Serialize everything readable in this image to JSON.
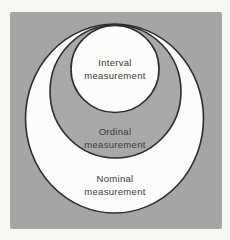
{
  "figure": {
    "colors": {
      "page_background": "#f8f7f4",
      "panel_gray": "#a5a5a5",
      "circle_white": "#fcfcfa",
      "ring_gray": "#a8a8a8",
      "outline": "#2e2c2a",
      "text": "#3b3b3b"
    },
    "levels": [
      {
        "name": "interval",
        "line1": "Interval",
        "line2": "measurement"
      },
      {
        "name": "ordinal",
        "line1": "Ordinal",
        "line2": "measurement"
      },
      {
        "name": "nominal",
        "line1": "Nominal",
        "line2": "measurement"
      }
    ]
  }
}
